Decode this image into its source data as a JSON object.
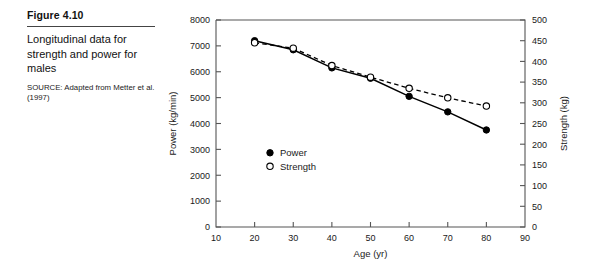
{
  "caption": {
    "figure_number": "Figure 4.10",
    "title": "Longitudinal data for strength and power for males",
    "source": "SOURCE: Adapted from Metter et al. (1997)"
  },
  "legend": {
    "position": "inside-lower-left",
    "entries": [
      {
        "label": "Power",
        "marker": "filled-circle"
      },
      {
        "label": "Strength",
        "marker": "open-circle"
      }
    ]
  },
  "chart_data": {
    "type": "line",
    "title": "",
    "xlabel": "Age (yr)",
    "ylabel": "Power (kg/min)",
    "y2label": "Strength (kg)",
    "x": [
      20,
      30,
      40,
      50,
      60,
      70,
      80
    ],
    "xlim": [
      10,
      90
    ],
    "ylim": [
      0,
      8000
    ],
    "y2lim": [
      0,
      500
    ],
    "xticks": [
      10,
      20,
      30,
      40,
      50,
      60,
      70,
      80,
      90
    ],
    "yticks": [
      0,
      1000,
      2000,
      3000,
      4000,
      5000,
      6000,
      7000,
      8000
    ],
    "y2ticks": [
      0,
      50,
      100,
      150,
      200,
      250,
      300,
      350,
      400,
      450,
      500
    ],
    "grid": false,
    "series": [
      {
        "name": "Power",
        "axis": "left",
        "units": "kg/min",
        "marker": "filled-circle",
        "linestyle": "solid",
        "color": "#000000",
        "values": [
          7200,
          6850,
          6150,
          5750,
          5050,
          4450,
          3750
        ]
      },
      {
        "name": "Strength",
        "axis": "right",
        "units": "kg",
        "marker": "open-circle",
        "linestyle": "dashed",
        "color": "#000000",
        "values": [
          445,
          432,
          390,
          362,
          335,
          312,
          292
        ]
      }
    ]
  }
}
